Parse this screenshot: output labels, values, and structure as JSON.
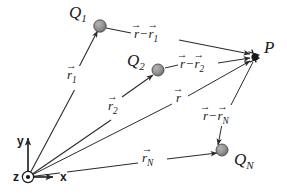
{
  "figure": {
    "type": "physics-vector-diagram",
    "width": 287,
    "height": 195,
    "background_color": "#ffffff",
    "line_color": "#2b2b2b",
    "charge_dot_color": "#8c8c8c",
    "charge_dot_edge_color": "#4a4a4a",
    "field_point_color": "#1a1a1a"
  },
  "axes": {
    "origin": {
      "x": 28,
      "y": 177
    },
    "x_label": "x",
    "y_label": "y",
    "z_label": "z",
    "z_symbol": "out-of-page-circle-dot"
  },
  "charges": [
    {
      "id": "Q1",
      "label": "Q",
      "subscript": "1",
      "dot": {
        "x": 100,
        "y": 26
      },
      "label_pos": {
        "x": 69,
        "y": 4
      }
    },
    {
      "id": "Q2",
      "label": "Q",
      "subscript": "2",
      "dot": {
        "x": 158,
        "y": 70
      },
      "label_pos": {
        "x": 127,
        "y": 52
      }
    },
    {
      "id": "QN",
      "label": "Q",
      "subscript": "N",
      "dot": {
        "x": 222,
        "y": 150
      },
      "label_pos": {
        "x": 234,
        "y": 151
      }
    }
  ],
  "field_point": {
    "id": "P",
    "label": "P",
    "pos": {
      "x": 255,
      "y": 57
    },
    "label_pos": {
      "x": 264,
      "y": 39
    }
  },
  "position_vectors": [
    {
      "id": "r1",
      "symbol": "r",
      "subscript": "1",
      "from": "origin",
      "to": "Q1",
      "label_pos": {
        "x": 66,
        "y": 68
      }
    },
    {
      "id": "r2",
      "symbol": "r",
      "subscript": "2",
      "from": "origin",
      "to": "Q2",
      "label_pos": {
        "x": 107,
        "y": 99
      }
    },
    {
      "id": "r",
      "symbol": "r",
      "subscript": "",
      "from": "origin",
      "to": "P",
      "label_pos": {
        "x": 175,
        "y": 91
      }
    },
    {
      "id": "rN",
      "symbol": "r",
      "subscript": "N",
      "from": "origin",
      "to": "QN",
      "label_pos": {
        "x": 141,
        "y": 151
      }
    }
  ],
  "separation_vectors": [
    {
      "id": "r-r1",
      "minuend": "r",
      "subtrahend_symbol": "r",
      "subtrahend_subscript": "1",
      "operator": "−",
      "from": "Q1",
      "to": "P",
      "label_pos": {
        "x": 133,
        "y": 27
      }
    },
    {
      "id": "r-r2",
      "minuend": "r",
      "subtrahend_symbol": "r",
      "subtrahend_subscript": "2",
      "operator": "−",
      "from": "Q2",
      "to": "P",
      "label_pos": {
        "x": 179,
        "y": 57
      }
    },
    {
      "id": "r-rN",
      "minuend": "r",
      "subtrahend_symbol": "r",
      "subtrahend_subscript": "N",
      "operator": "−",
      "from": "P",
      "to": "QN",
      "label_pos": {
        "x": 202,
        "y": 109
      }
    }
  ],
  "glyphs": {
    "vector_arrow": "→"
  }
}
